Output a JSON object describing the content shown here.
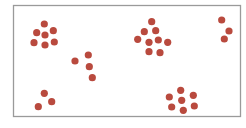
{
  "chart_data": {
    "type": "scatter",
    "title": "",
    "xlabel": "",
    "ylabel": "",
    "grid": false,
    "legend": null,
    "frame": {
      "x": 13,
      "y": 5,
      "width": 227,
      "height": 111,
      "stroke": "#9a9a9a"
    },
    "point_color": "#b94a3e",
    "point_radius": 3.6,
    "clusters": [
      {
        "name": "cluster-1",
        "points": [
          [
            44.3,
            24
          ],
          [
            36.7,
            32.7
          ],
          [
            45,
            35
          ],
          [
            53.3,
            30.7
          ],
          [
            34,
            42.7
          ],
          [
            45,
            45
          ],
          [
            54.3,
            42
          ]
        ]
      },
      {
        "name": "cluster-2",
        "points": [
          [
            75,
            61
          ],
          [
            88.3,
            55
          ],
          [
            89.3,
            66.7
          ],
          [
            92.3,
            77.7
          ]
        ]
      },
      {
        "name": "cluster-3",
        "points": [
          [
            151.7,
            21.7
          ],
          [
            144.3,
            31.7
          ],
          [
            155.7,
            30.7
          ],
          [
            137.7,
            39.3
          ],
          [
            149,
            42.3
          ],
          [
            158.3,
            40
          ],
          [
            167.7,
            42.3
          ],
          [
            149,
            51.7
          ],
          [
            160,
            52.7
          ]
        ]
      },
      {
        "name": "cluster-4",
        "points": [
          [
            221.7,
            20
          ],
          [
            229,
            31
          ],
          [
            224.3,
            39
          ]
        ]
      },
      {
        "name": "cluster-5",
        "points": [
          [
            44.3,
            93.3
          ],
          [
            51.7,
            101.7
          ],
          [
            38.3,
            106.7
          ]
        ]
      },
      {
        "name": "cluster-6",
        "points": [
          [
            180.7,
            90.3
          ],
          [
            169.3,
            97
          ],
          [
            193.3,
            95.3
          ],
          [
            181.7,
            100.3
          ],
          [
            171.7,
            107
          ],
          [
            183.3,
            110.3
          ],
          [
            194.3,
            106
          ]
        ]
      }
    ]
  }
}
